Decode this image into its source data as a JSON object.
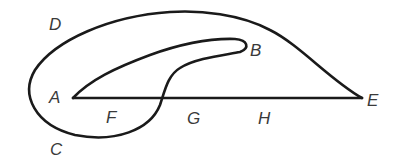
{
  "diagram": {
    "type": "curve-figure",
    "stroke_color": "#1a1a1a",
    "label_color": "#3a3a3a",
    "labels": {
      "A": "A",
      "B": "B",
      "C": "C",
      "D": "D",
      "E": "E",
      "F": "F",
      "G": "G",
      "H": "H"
    }
  }
}
